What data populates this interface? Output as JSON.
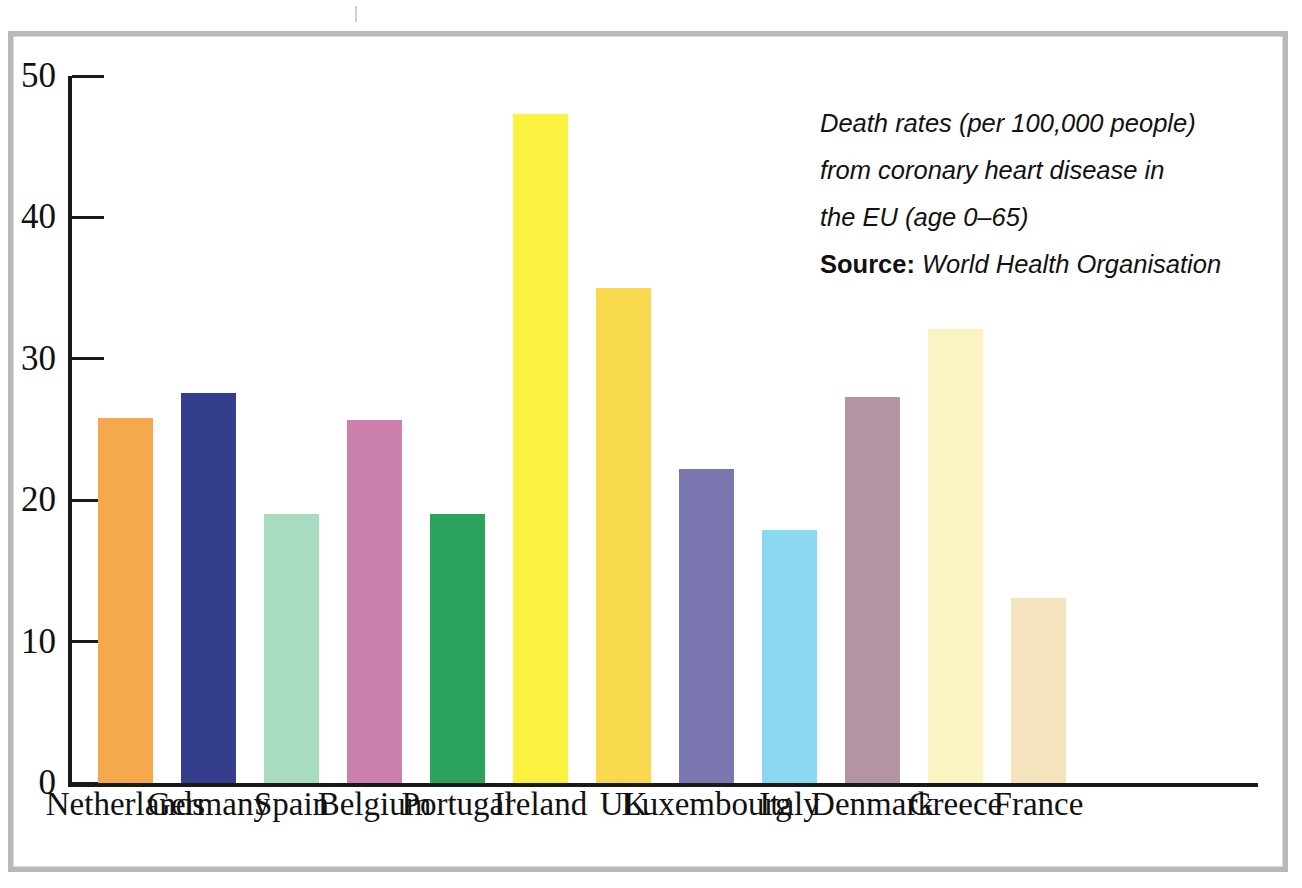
{
  "chart_data": {
    "type": "bar",
    "title": "Death rates (per 100,000 people) from coronary heart disease in the EU (age 0–65)",
    "xlabel": "",
    "ylabel": "",
    "ylim": [
      0,
      50
    ],
    "yticks": [
      0,
      10,
      20,
      30,
      40,
      50
    ],
    "grid": false,
    "legend": "none",
    "categories": [
      "Netherlands",
      "Germany",
      "Spain",
      "Belgium",
      "Portugal",
      "Ireland",
      "UK",
      "Luxembourg",
      "Italy",
      "Denmark",
      "Greece",
      "France"
    ],
    "values": [
      25.8,
      27.6,
      19.0,
      25.7,
      19.0,
      47.3,
      35.0,
      22.2,
      17.9,
      27.3,
      32.1,
      13.1
    ],
    "colors": [
      "#f5a94c",
      "#343e8c",
      "#a8dcc0",
      "#cc80ae",
      "#2ba35d",
      "#fbf23f",
      "#f8d94e",
      "#7a77b0",
      "#8bd8f3",
      "#b394a4",
      "#fbf4c2",
      "#f3e4bd"
    ]
  },
  "annotation": {
    "line1": "Death rates (per 100,000 people)",
    "line2": "from coronary heart disease in",
    "line3": "the EU (age 0–65)",
    "source_label": "Source:",
    "source_value": "World Health Organisation"
  },
  "axis": {
    "tick_labels": [
      "50",
      "40",
      "30",
      "20",
      "10",
      "0"
    ]
  }
}
